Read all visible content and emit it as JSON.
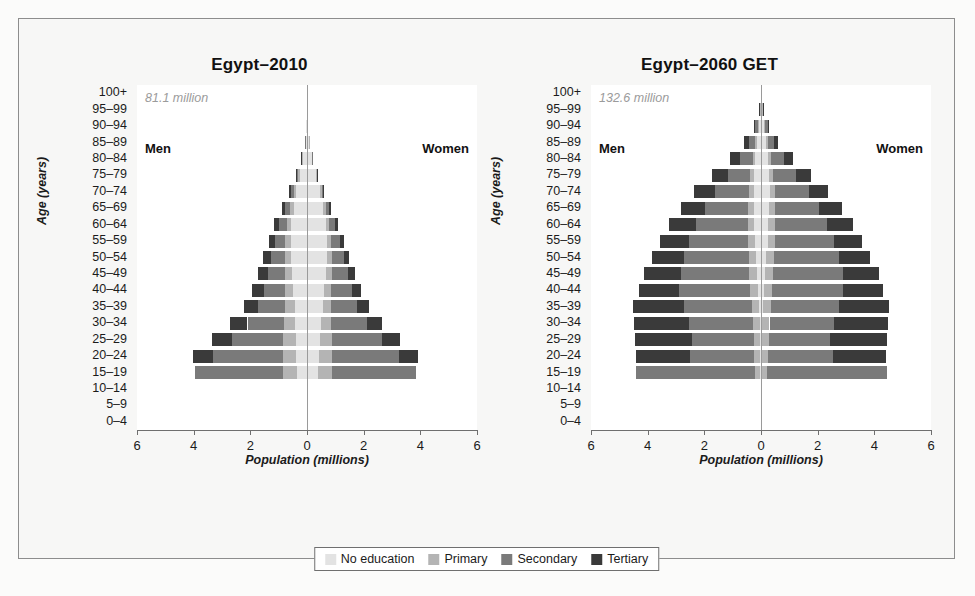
{
  "figure": {
    "background": "#fbfbfa",
    "frame_border": "#8d8d8d"
  },
  "legend": {
    "position": "bottom-center",
    "items": [
      {
        "label": "No education",
        "color": "#e3e3e3"
      },
      {
        "label": "Primary",
        "color": "#b4b4b4"
      },
      {
        "label": "Secondary",
        "color": "#7a7a7a"
      },
      {
        "label": "Tertiary",
        "color": "#3a3a3a"
      }
    ]
  },
  "axis": {
    "y_title": "Age (years)",
    "x_title": "Population (millions)",
    "x_ticks": [
      "6",
      "4",
      "2",
      "0",
      "2",
      "4",
      "6"
    ],
    "x_tick_values": [
      -6,
      -4,
      -2,
      0,
      2,
      4,
      6
    ],
    "xlim": [
      -6,
      6
    ],
    "age_groups": [
      "100+",
      "95–99",
      "90–94",
      "85–89",
      "80–84",
      "75–79",
      "70–74",
      "65–69",
      "60–64",
      "55–59",
      "50–54",
      "45–49",
      "40–44",
      "35–39",
      "30–34",
      "25–29",
      "20–24",
      "15–19",
      "10–14",
      "5–9",
      "0–4"
    ],
    "men_label": "Men",
    "women_label": "Women"
  },
  "chart_data": [
    {
      "type": "bar",
      "orientation": "population-pyramid",
      "title": "Egypt–2010",
      "annotation": "81.1 million",
      "xlabel": "Population (millions)",
      "ylabel": "Age (years)",
      "xlim": [
        -6,
        6
      ],
      "grid": false,
      "categories": [
        "100+",
        "95–99",
        "90–94",
        "85–89",
        "80–84",
        "75–79",
        "70–74",
        "65–69",
        "60–64",
        "55–59",
        "50–54",
        "45–49",
        "40–44",
        "35–39",
        "30–34",
        "25–29",
        "20–24",
        "15–19",
        "10–14",
        "5–9",
        "0–4"
      ],
      "education_levels": [
        "No education",
        "Primary",
        "Secondary",
        "Tertiary"
      ],
      "men": {
        "100+": [
          0.0,
          0.0,
          0.0,
          0.0
        ],
        "95–99": [
          0.0,
          0.0,
          0.0,
          0.0
        ],
        "90–94": [
          0.02,
          0.0,
          0.0,
          0.0
        ],
        "85–89": [
          0.05,
          0.01,
          0.01,
          0.0
        ],
        "80–84": [
          0.14,
          0.03,
          0.03,
          0.01
        ],
        "75–79": [
          0.25,
          0.06,
          0.06,
          0.03
        ],
        "70–74": [
          0.38,
          0.09,
          0.11,
          0.06
        ],
        "65–69": [
          0.47,
          0.13,
          0.18,
          0.1
        ],
        "60–64": [
          0.55,
          0.17,
          0.27,
          0.16
        ],
        "55–59": [
          0.57,
          0.2,
          0.36,
          0.22
        ],
        "50–54": [
          0.56,
          0.23,
          0.47,
          0.29
        ],
        "45–49": [
          0.52,
          0.26,
          0.6,
          0.35
        ],
        "40–44": [
          0.48,
          0.29,
          0.76,
          0.42
        ],
        "35–39": [
          0.44,
          0.33,
          0.95,
          0.5
        ],
        "30–34": [
          0.42,
          0.38,
          1.3,
          0.61
        ],
        "25–29": [
          0.4,
          0.44,
          1.82,
          0.7
        ],
        "20–24": [
          0.38,
          0.48,
          2.46,
          0.7
        ],
        "15–19": [
          0.34,
          0.52,
          3.1,
          0.0
        ],
        "10–14": [
          0.0,
          0.0,
          0.0,
          0.0
        ],
        "5–9": [
          0.0,
          0.0,
          0.0,
          0.0
        ],
        "0–4": [
          0.0,
          0.0,
          0.0,
          0.0
        ]
      },
      "women": {
        "100+": [
          0.0,
          0.0,
          0.0,
          0.0
        ],
        "95–99": [
          0.0,
          0.0,
          0.0,
          0.0
        ],
        "90–94": [
          0.02,
          0.0,
          0.0,
          0.0
        ],
        "85–89": [
          0.06,
          0.01,
          0.0,
          0.0
        ],
        "80–84": [
          0.17,
          0.02,
          0.01,
          0.0
        ],
        "75–79": [
          0.3,
          0.04,
          0.03,
          0.01
        ],
        "70–74": [
          0.45,
          0.07,
          0.06,
          0.02
        ],
        "65–69": [
          0.56,
          0.1,
          0.12,
          0.05
        ],
        "60–64": [
          0.66,
          0.13,
          0.2,
          0.09
        ],
        "55–59": [
          0.7,
          0.16,
          0.3,
          0.14
        ],
        "50–54": [
          0.7,
          0.19,
          0.41,
          0.2
        ],
        "45–49": [
          0.66,
          0.22,
          0.55,
          0.27
        ],
        "40–44": [
          0.6,
          0.26,
          0.72,
          0.34
        ],
        "35–39": [
          0.55,
          0.3,
          0.92,
          0.43
        ],
        "30–34": [
          0.5,
          0.35,
          1.26,
          0.55
        ],
        "25–29": [
          0.46,
          0.41,
          1.76,
          0.66
        ],
        "20–24": [
          0.42,
          0.46,
          2.36,
          0.68
        ],
        "15–19": [
          0.38,
          0.5,
          2.95,
          0.0
        ],
        "10–14": [
          0.0,
          0.0,
          0.0,
          0.0
        ],
        "5–9": [
          0.0,
          0.0,
          0.0,
          0.0
        ],
        "0–4": [
          0.0,
          0.0,
          0.0,
          0.0
        ]
      }
    },
    {
      "type": "bar",
      "orientation": "population-pyramid",
      "title": "Egypt–2060 GET",
      "annotation": "132.6 million",
      "xlabel": "Population (millions)",
      "ylabel": "Age (years)",
      "xlim": [
        -6,
        6
      ],
      "grid": false,
      "categories": [
        "100+",
        "95–99",
        "90–94",
        "85–89",
        "80–84",
        "75–79",
        "70–74",
        "65–69",
        "60–64",
        "55–59",
        "50–54",
        "45–49",
        "40–44",
        "35–39",
        "30–34",
        "25–29",
        "20–24",
        "15–19",
        "10–14",
        "5–9",
        "0–4"
      ],
      "education_levels": [
        "No education",
        "Primary",
        "Secondary",
        "Tertiary"
      ],
      "men": {
        "100+": [
          0.01,
          0.0,
          0.0,
          0.0
        ],
        "95–99": [
          0.04,
          0.01,
          0.02,
          0.01
        ],
        "90–94": [
          0.08,
          0.03,
          0.09,
          0.06
        ],
        "85–89": [
          0.14,
          0.06,
          0.22,
          0.17
        ],
        "80–84": [
          0.2,
          0.1,
          0.45,
          0.35
        ],
        "75–79": [
          0.24,
          0.14,
          0.78,
          0.56
        ],
        "70–74": [
          0.26,
          0.17,
          1.18,
          0.74
        ],
        "65–69": [
          0.26,
          0.2,
          1.52,
          0.85
        ],
        "60–64": [
          0.24,
          0.22,
          1.82,
          0.95
        ],
        "55–59": [
          0.22,
          0.24,
          2.08,
          1.02
        ],
        "50–54": [
          0.18,
          0.26,
          2.28,
          1.12
        ],
        "45–49": [
          0.14,
          0.28,
          2.42,
          1.3
        ],
        "40–44": [
          0.1,
          0.28,
          2.5,
          1.42
        ],
        "35–39": [
          0.07,
          0.26,
          2.38,
          1.82
        ],
        "30–34": [
          0.05,
          0.24,
          2.25,
          1.95
        ],
        "25–29": [
          0.04,
          0.22,
          2.18,
          2.0
        ],
        "20–24": [
          0.03,
          0.2,
          2.28,
          1.9
        ],
        "15–19": [
          0.02,
          0.18,
          4.2,
          0.0
        ],
        "10–14": [
          0.0,
          0.0,
          0.0,
          0.0
        ],
        "5–9": [
          0.0,
          0.0,
          0.0,
          0.0
        ],
        "0–4": [
          0.0,
          0.0,
          0.0,
          0.0
        ]
      },
      "women": {
        "100+": [
          0.02,
          0.0,
          0.0,
          0.0
        ],
        "95–99": [
          0.05,
          0.01,
          0.02,
          0.01
        ],
        "90–94": [
          0.11,
          0.03,
          0.09,
          0.05
        ],
        "85–89": [
          0.18,
          0.06,
          0.22,
          0.15
        ],
        "80–84": [
          0.25,
          0.1,
          0.46,
          0.32
        ],
        "75–79": [
          0.29,
          0.14,
          0.8,
          0.52
        ],
        "70–74": [
          0.3,
          0.18,
          1.2,
          0.7
        ],
        "65–69": [
          0.29,
          0.21,
          1.55,
          0.82
        ],
        "60–64": [
          0.26,
          0.23,
          1.85,
          0.92
        ],
        "55–59": [
          0.23,
          0.25,
          2.1,
          1.0
        ],
        "50–54": [
          0.19,
          0.27,
          2.3,
          1.1
        ],
        "45–49": [
          0.15,
          0.28,
          2.45,
          1.28
        ],
        "40–44": [
          0.11,
          0.28,
          2.52,
          1.4
        ],
        "35–39": [
          0.08,
          0.27,
          2.4,
          1.78
        ],
        "30–34": [
          0.05,
          0.25,
          2.26,
          1.92
        ],
        "25–29": [
          0.04,
          0.23,
          2.18,
          1.98
        ],
        "20–24": [
          0.03,
          0.21,
          2.3,
          1.88
        ],
        "15–19": [
          0.02,
          0.19,
          4.25,
          0.0
        ],
        "10–14": [
          0.0,
          0.0,
          0.0,
          0.0
        ],
        "5–9": [
          0.0,
          0.0,
          0.0,
          0.0
        ],
        "0–4": [
          0.0,
          0.0,
          0.0,
          0.0
        ]
      }
    }
  ]
}
